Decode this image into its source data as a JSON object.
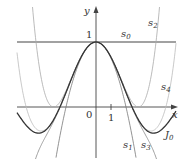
{
  "figure": {
    "type": "function-approximation-diagram",
    "axes": {
      "x_label": "x",
      "y_label": "y",
      "origin_label": "0",
      "x_tick_label": "1",
      "y_tick_label": "1"
    },
    "curves": [
      {
        "id": "s0",
        "label": "s",
        "subscript": "0",
        "color": "#444444"
      },
      {
        "id": "s1",
        "label": "s",
        "subscript": "1",
        "color": "#777777"
      },
      {
        "id": "s2",
        "label": "s",
        "subscript": "2",
        "color": "#aaaaaa"
      },
      {
        "id": "s3",
        "label": "s",
        "subscript": "3",
        "color": "#888888"
      },
      {
        "id": "s4",
        "label": "s",
        "subscript": "4",
        "color": "#bbbbbb"
      },
      {
        "id": "J0",
        "label": "J",
        "subscript": "0",
        "color": "#333333"
      }
    ]
  }
}
